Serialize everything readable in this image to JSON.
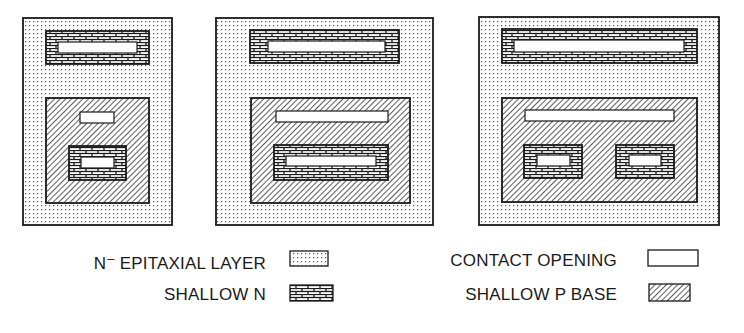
{
  "colors": {
    "ink": "#1a1a1a",
    "background": "#ffffff",
    "dot": "#555555"
  },
  "layers": {
    "epitaxial": {
      "pattern": "dots",
      "name": "N- epitaxial layer"
    },
    "shallow_n": {
      "pattern": "bricks",
      "name": "Shallow N"
    },
    "contact": {
      "pattern": "none",
      "name": "Contact opening"
    },
    "p_base": {
      "pattern": "diagonal-hatch",
      "name": "Shallow P base"
    }
  },
  "panels": [
    {
      "id": "panel-1",
      "epitaxial": [
        23,
        18,
        149,
        207
      ],
      "top_shallow_n": [
        46,
        31,
        103,
        33
      ],
      "top_contact": [
        58,
        42,
        79,
        11
      ],
      "p_base": [
        46,
        98,
        103,
        105
      ],
      "p_contacts": [
        [
          80,
          112,
          34,
          11
        ]
      ],
      "emitters": [
        {
          "shallow_n": [
            69,
            146,
            57,
            34
          ],
          "contact": [
            81,
            157,
            33,
            11
          ]
        }
      ]
    },
    {
      "id": "panel-2",
      "epitaxial": [
        216,
        18,
        217,
        207
      ],
      "top_shallow_n": [
        250,
        30,
        149,
        33
      ],
      "top_contact": [
        268,
        41,
        117,
        11
      ],
      "p_base": [
        251,
        98,
        159,
        105
      ],
      "p_contacts": [
        [
          276,
          111,
          112,
          11
        ]
      ],
      "emitters": [
        {
          "shallow_n": [
            274,
            145,
            114,
            35
          ],
          "contact": [
            286,
            156,
            90,
            10
          ]
        }
      ]
    },
    {
      "id": "panel-3",
      "epitaxial": [
        479,
        17,
        240,
        208
      ],
      "top_shallow_n": [
        502,
        29,
        195,
        34
      ],
      "top_contact": [
        514,
        40,
        170,
        12
      ],
      "p_base": [
        502,
        98,
        195,
        104
      ],
      "p_contacts": [
        [
          525,
          110,
          149,
          11
        ]
      ],
      "emitters": [
        {
          "shallow_n": [
            524,
            145,
            58,
            33
          ],
          "contact": [
            537,
            155,
            33,
            11
          ]
        },
        {
          "shallow_n": [
            616,
            145,
            58,
            33
          ],
          "contact": [
            629,
            155,
            32,
            11
          ]
        }
      ]
    }
  ],
  "legend": {
    "items": [
      {
        "key": "epitaxial",
        "label_main": "N",
        "label_sup": "–",
        "label_rest": " EPITAXIAL LAYER",
        "label_right": 266,
        "label_top": 252,
        "swatch": [
          290,
          251,
          38,
          15
        ]
      },
      {
        "key": "shallow_n",
        "label": "SHALLOW N",
        "label_right": 266,
        "label_top": 286,
        "swatch": [
          290,
          285,
          43,
          16
        ]
      },
      {
        "key": "contact",
        "label": "CONTACT  OPENING",
        "label_right": 617,
        "label_top": 252,
        "swatch": [
          648,
          250,
          50,
          16
        ]
      },
      {
        "key": "p_base",
        "label": "SHALLOW P BASE",
        "label_right": 617,
        "label_top": 286,
        "swatch": [
          649,
          284,
          41,
          17
        ]
      }
    ]
  }
}
